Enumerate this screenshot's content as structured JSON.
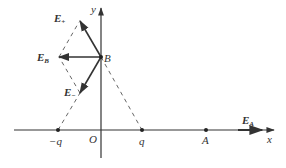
{
  "diagram": {
    "type": "electric-field-vector-diagram",
    "axes": {
      "x_label": "x",
      "y_label": "y",
      "origin_label": "O"
    },
    "charges": [
      {
        "label": "−q",
        "position": "negative x-axis"
      },
      {
        "label": "q",
        "position": "positive x-axis"
      }
    ],
    "points": {
      "B": {
        "label": "B",
        "position": "positive y-axis"
      },
      "A": {
        "label": "A",
        "position": "positive x-axis"
      }
    },
    "vectors": {
      "E_plus": {
        "base": "E",
        "sub": "+"
      },
      "E_minus": {
        "base": "E",
        "sub": "−"
      },
      "E_B": {
        "base": "E",
        "sub": "B"
      },
      "E_A": {
        "base": "E",
        "sub": "A"
      }
    },
    "colors": {
      "line": "#333333",
      "dashed": "#555555",
      "background": "#ffffff"
    }
  }
}
